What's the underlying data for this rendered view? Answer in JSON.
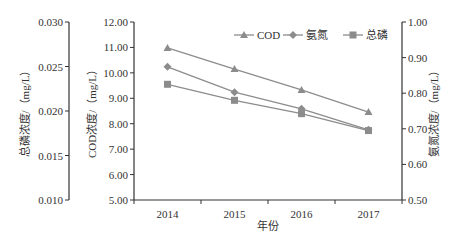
{
  "chart_data": {
    "type": "line",
    "title": "",
    "xlabel": "年份",
    "categories": [
      "2014",
      "2015",
      "2016",
      "2017"
    ],
    "axes": {
      "cod": {
        "label": "COD浓度/（mg/L）",
        "position": "left-inner",
        "range": [
          5.0,
          12.0
        ],
        "ticks": [
          "5.00",
          "6.00",
          "7.00",
          "8.00",
          "9.00",
          "10.00",
          "11.00",
          "12.00"
        ]
      },
      "tp": {
        "label": "总磷浓度/（mg/L）",
        "position": "left-outer",
        "range": [
          0.01,
          0.03
        ],
        "ticks": [
          "0.010",
          "0.015",
          "0.020",
          "0.025",
          "0.030"
        ]
      },
      "nh3": {
        "label": "氨氮浓度/（mg/L）",
        "position": "right",
        "range": [
          0.5,
          1.0
        ],
        "ticks": [
          "0.50",
          "0.60",
          "0.70",
          "0.80",
          "0.90",
          "1.00"
        ]
      }
    },
    "series": [
      {
        "name": "COD",
        "axis": "cod",
        "marker": "triangle",
        "values": [
          10.98,
          10.15,
          9.33,
          8.46
        ]
      },
      {
        "name": "氨氮",
        "axis": "nh3",
        "marker": "diamond",
        "values": [
          0.874,
          0.803,
          0.756,
          0.697
        ]
      },
      {
        "name": "总磷",
        "axis": "tp",
        "marker": "square",
        "values": [
          0.023,
          0.0212,
          0.0197,
          0.0178
        ]
      }
    ],
    "legend": {
      "position": "top-right",
      "entries": [
        "COD",
        "氨氮",
        "总磷"
      ]
    },
    "grid": false,
    "colors": {
      "line": "#8c8c8c",
      "marker": "#8c8c8c",
      "axis": "#333333"
    }
  }
}
